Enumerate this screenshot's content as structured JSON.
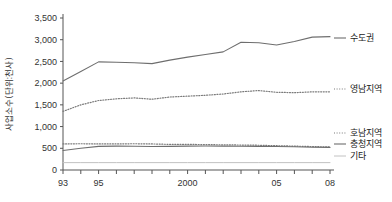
{
  "chart_data": {
    "type": "line",
    "title": "",
    "xlabel": "",
    "ylabel": "사업소수(단위:천사)",
    "ylim": [
      0,
      3500
    ],
    "xlim": [
      1993,
      2008
    ],
    "grid": false,
    "legend_position": "right-inline",
    "y_ticks": [
      "0",
      "500",
      "1,000",
      "1,500",
      "2,000",
      "2,500",
      "3,000",
      "3,500"
    ],
    "y_tick_values": [
      0,
      500,
      1000,
      1500,
      2000,
      2500,
      3000,
      3500
    ],
    "x": [
      1993,
      1994,
      1995,
      1996,
      1997,
      1998,
      1999,
      2000,
      2001,
      2002,
      2003,
      2004,
      2005,
      2006,
      2007,
      2008
    ],
    "x_tick_labels": [
      {
        "value": 1993,
        "label": "93"
      },
      {
        "value": 1995,
        "label": "95"
      },
      {
        "value": 2000,
        "label": "2000"
      },
      {
        "value": 2005,
        "label": "05"
      },
      {
        "value": 2008,
        "label": "08"
      }
    ],
    "series": [
      {
        "name": "수도권",
        "style": "solid",
        "color": "#6e6e6e",
        "values": [
          2050,
          2270,
          2490,
          2480,
          2470,
          2450,
          2530,
          2600,
          2660,
          2720,
          2940,
          2930,
          2880,
          2960,
          3060,
          3070
        ]
      },
      {
        "name": "영남지역",
        "style": "dotted",
        "color": "#7a7a7a",
        "values": [
          1350,
          1500,
          1600,
          1640,
          1660,
          1630,
          1680,
          1700,
          1720,
          1750,
          1800,
          1830,
          1790,
          1780,
          1800,
          1800
        ]
      },
      {
        "name": "호남지역",
        "style": "dotted",
        "color": "#7a7a7a",
        "values": [
          600,
          605,
          600,
          600,
          605,
          600,
          590,
          590,
          585,
          580,
          575,
          570,
          560,
          550,
          540,
          530
        ]
      },
      {
        "name": "충청지역",
        "style": "solid",
        "color": "#6e6e6e",
        "values": [
          450,
          500,
          545,
          550,
          548,
          540,
          545,
          550,
          552,
          550,
          548,
          545,
          540,
          535,
          525,
          520
        ]
      },
      {
        "name": "기타",
        "style": "solid",
        "color": "#c2c2c2",
        "values": [
          170,
          170,
          170,
          170,
          170,
          170,
          170,
          170,
          170,
          170,
          170,
          170,
          170,
          170,
          170,
          170
        ]
      }
    ]
  },
  "colors": {
    "background": "#ffffff",
    "axis": "#555555",
    "text": "#2b2b2b"
  }
}
